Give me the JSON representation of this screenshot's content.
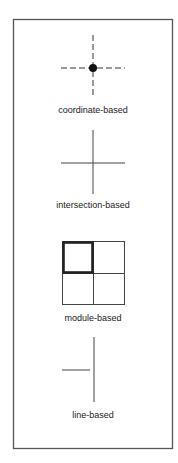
{
  "figure": {
    "frame": {
      "x": 13,
      "y": 19,
      "width": 160,
      "height": 430,
      "stroke": "#555555"
    },
    "line_color": "#333333",
    "panels": [
      {
        "id": "coordinate",
        "label": "coordinate-based",
        "label_y": 105
      },
      {
        "id": "intersection",
        "label": "intersection-based",
        "label_y": 200
      },
      {
        "id": "module",
        "label": "module-based",
        "label_y": 313
      },
      {
        "id": "line",
        "label": "line-based",
        "label_y": 410
      }
    ]
  }
}
